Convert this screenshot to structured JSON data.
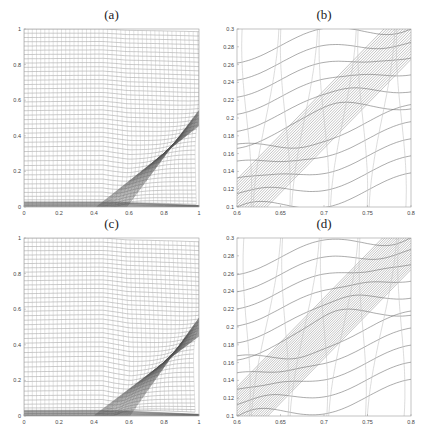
{
  "figure": {
    "panels": [
      {
        "id": "a",
        "title": "(a)",
        "box": {
          "x": 24,
          "y": 29,
          "w": 175,
          "h": 178
        },
        "xlim": [
          0,
          1
        ],
        "ylim": [
          0,
          1
        ],
        "xticks": [
          0,
          0.2,
          0.4,
          0.6,
          0.8,
          1
        ],
        "xticklabels": [
          "0",
          "0.2",
          "0.4",
          "0.6",
          "0.8",
          "1"
        ],
        "yticks": [
          0,
          0.2,
          0.4,
          0.6,
          0.8,
          1
        ],
        "yticklabels": [
          "0",
          "0.2",
          "0.4",
          "0.6",
          "0.8",
          "1"
        ],
        "mesh": {
          "kind": "full",
          "strength": 0.6
        }
      },
      {
        "id": "b",
        "title": "(b)",
        "box": {
          "x": 237,
          "y": 29,
          "w": 174,
          "h": 178
        },
        "xlim": [
          0.6,
          0.8
        ],
        "ylim": [
          0.1,
          0.3
        ],
        "xticks": [
          0.6,
          0.65,
          0.7,
          0.75,
          0.8
        ],
        "xticklabels": [
          "0.6",
          "0.65",
          "0.7",
          "0.75",
          "0.8"
        ],
        "yticks": [
          0.1,
          0.12,
          0.14,
          0.16,
          0.18,
          0.2,
          0.22,
          0.24,
          0.26,
          0.28,
          0.3
        ],
        "yticklabels": [
          "0.1",
          "0.12",
          "0.14",
          "0.16",
          "0.18",
          "0.2",
          "0.22",
          "0.24",
          "0.26",
          "0.28",
          "0.3"
        ],
        "mesh": {
          "kind": "zoom",
          "strength": 0.6
        }
      },
      {
        "id": "c",
        "title": "(c)",
        "box": {
          "x": 24,
          "y": 238,
          "w": 175,
          "h": 178
        },
        "xlim": [
          0,
          1
        ],
        "ylim": [
          0,
          1
        ],
        "xticks": [
          0,
          0.2,
          0.4,
          0.6,
          0.8,
          1
        ],
        "xticklabels": [
          "0",
          "0.2",
          "0.4",
          "0.6",
          "0.8",
          "1"
        ],
        "yticks": [
          0,
          0.2,
          0.4,
          0.6,
          0.8,
          1
        ],
        "yticklabels": [
          "0",
          "0.2",
          "0.4",
          "0.6",
          "0.8",
          "1"
        ],
        "mesh": {
          "kind": "full",
          "strength": 0.85
        }
      },
      {
        "id": "d",
        "title": "(d)",
        "box": {
          "x": 237,
          "y": 238,
          "w": 174,
          "h": 178
        },
        "xlim": [
          0.6,
          0.8
        ],
        "ylim": [
          0.1,
          0.3
        ],
        "xticks": [
          0.6,
          0.65,
          0.7,
          0.75,
          0.8
        ],
        "xticklabels": [
          "0.6",
          "0.65",
          "0.7",
          "0.75",
          "0.8"
        ],
        "yticks": [
          0.1,
          0.12,
          0.14,
          0.16,
          0.18,
          0.2,
          0.22,
          0.24,
          0.26,
          0.28,
          0.3
        ],
        "yticklabels": [
          "0.1",
          "0.12",
          "0.14",
          "0.16",
          "0.18",
          "0.2",
          "0.22",
          "0.24",
          "0.26",
          "0.28",
          "0.3"
        ],
        "mesh": {
          "kind": "zoom",
          "strength": 0.85
        }
      }
    ],
    "colors": {
      "mesh": "#8a8a8a",
      "mesh_dense": "#555555",
      "axis": "#9a9a9a",
      "tick_label": "#444444"
    }
  },
  "chart_data": [
    {
      "type": "line",
      "title": "(a)",
      "description": "Adaptive moving mesh on unit square concentrated along an oblique shock from (0.5,0) to (1,0.5) and along the bottom boundary",
      "xlabel": "",
      "ylabel": "",
      "xlim": [
        0,
        1
      ],
      "ylim": [
        0,
        1
      ],
      "xticks": [
        "0",
        "0.2",
        "0.4",
        "0.6",
        "0.8",
        "1"
      ],
      "yticks": [
        "0",
        "0.2",
        "0.4",
        "0.6",
        "0.8",
        "1"
      ],
      "features": {
        "shock_line": {
          "x": [
            0.5,
            1.0
          ],
          "y": [
            0.0,
            0.5
          ]
        },
        "grid_lines_approx": 40
      },
      "grid": false,
      "legend": null
    },
    {
      "type": "line",
      "title": "(b)",
      "description": "Zoomed view of mesh (a) near the shock",
      "xlim": [
        0.6,
        0.8
      ],
      "ylim": [
        0.1,
        0.3
      ],
      "xticks": [
        "0.6",
        "0.65",
        "0.7",
        "0.75",
        "0.8"
      ],
      "yticks": [
        "0.1",
        "0.12",
        "0.14",
        "0.16",
        "0.18",
        "0.2",
        "0.22",
        "0.24",
        "0.26",
        "0.28",
        "0.3"
      ],
      "features": {
        "shock_line": {
          "x": [
            0.6,
            0.8
          ],
          "y": [
            0.1,
            0.3
          ]
        }
      },
      "grid": false,
      "legend": null
    },
    {
      "type": "line",
      "title": "(c)",
      "description": "Adaptive moving mesh with stronger concentration along shock and bottom boundary",
      "xlim": [
        0,
        1
      ],
      "ylim": [
        0,
        1
      ],
      "xticks": [
        "0",
        "0.2",
        "0.4",
        "0.6",
        "0.8",
        "1"
      ],
      "yticks": [
        "0",
        "0.2",
        "0.4",
        "0.6",
        "0.8",
        "1"
      ],
      "features": {
        "shock_line": {
          "x": [
            0.5,
            1.0
          ],
          "y": [
            0.0,
            0.5
          ]
        },
        "grid_lines_approx": 40
      },
      "grid": false,
      "legend": null
    },
    {
      "type": "line",
      "title": "(d)",
      "description": "Zoomed view of mesh (c) near the shock",
      "xlim": [
        0.6,
        0.8
      ],
      "ylim": [
        0.1,
        0.3
      ],
      "xticks": [
        "0.6",
        "0.65",
        "0.7",
        "0.75",
        "0.8"
      ],
      "yticks": [
        "0.1",
        "0.12",
        "0.14",
        "0.16",
        "0.18",
        "0.2",
        "0.22",
        "0.24",
        "0.26",
        "0.28",
        "0.3"
      ],
      "features": {
        "shock_line": {
          "x": [
            0.6,
            0.8
          ],
          "y": [
            0.1,
            0.3
          ]
        }
      },
      "grid": false,
      "legend": null
    }
  ]
}
